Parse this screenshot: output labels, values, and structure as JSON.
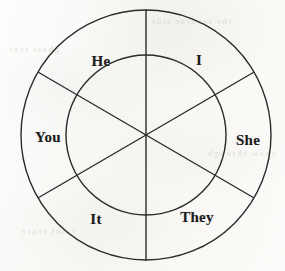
{
  "diagram": {
    "type": "segmented-circle",
    "shape": {
      "center_x": 146,
      "center_y": 135,
      "outer_radius": 125,
      "inner_radius": 80,
      "segment_count": 6,
      "line_color": "#2b2b2b",
      "line_width": 1.4,
      "fill": "none"
    },
    "spokes": [
      {
        "name": "vertical-spoke",
        "angle_deg": 90
      },
      {
        "name": "upper-right-spoke",
        "angle_deg": 30
      },
      {
        "name": "upper-left-spoke",
        "angle_deg": 150
      }
    ],
    "segments": [
      {
        "id": "he",
        "label": "He",
        "position": "upper-left",
        "x": 101,
        "y": 61
      },
      {
        "id": "i",
        "label": "I",
        "position": "upper-right",
        "x": 199,
        "y": 60
      },
      {
        "id": "you",
        "label": "You",
        "position": "left",
        "x": 48,
        "y": 137
      },
      {
        "id": "she",
        "label": "She",
        "position": "right",
        "x": 248,
        "y": 140
      },
      {
        "id": "it",
        "label": "It",
        "position": "lower-left",
        "x": 96,
        "y": 219
      },
      {
        "id": "they",
        "label": "They",
        "position": "lower-right",
        "x": 197,
        "y": 217
      }
    ]
  },
  "background": {
    "paper_color": "#faf9f7",
    "ink_color": "#1b1b1b",
    "bleed_through": [
      {
        "id": "bleed-top-right",
        "text": "the reverse side",
        "x": 150,
        "y": 16
      },
      {
        "id": "bleed-left",
        "text": "ghost text",
        "x": 8,
        "y": 44
      },
      {
        "id": "bleed-mid",
        "text": "show through",
        "x": 206,
        "y": 148
      },
      {
        "id": "bleed-bottom",
        "text": "faint trace",
        "x": 20,
        "y": 226
      }
    ]
  }
}
